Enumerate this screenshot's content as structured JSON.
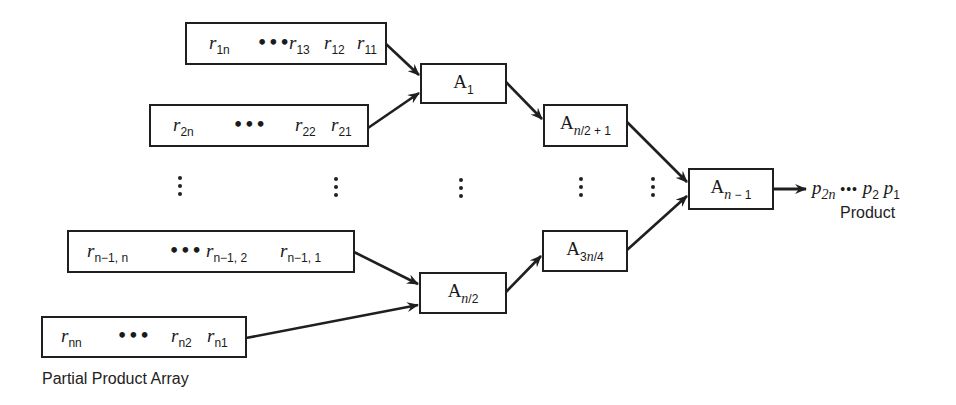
{
  "diagram": {
    "type": "tree-adder",
    "rows": [
      {
        "id": "row-1",
        "terms": [
          {
            "base": "r",
            "sub": "1n"
          },
          {
            "dots": "•••"
          },
          {
            "base": "r",
            "sub": "13"
          },
          {
            "base": "r",
            "sub": "12"
          },
          {
            "base": "r",
            "sub": "11"
          }
        ]
      },
      {
        "id": "row-2",
        "terms": [
          {
            "base": "r",
            "sub": "2n"
          },
          {
            "dots": "•••"
          },
          {
            "base": "r",
            "sub": "22"
          },
          {
            "base": "r",
            "sub": "21"
          }
        ]
      },
      {
        "id": "row-n-1",
        "terms": [
          {
            "base": "r",
            "sub": "n−1, n"
          },
          {
            "dots": "•••"
          },
          {
            "base": "r",
            "sub": "n−1, 2"
          },
          {
            "base": "r",
            "sub": "n−1, 1"
          }
        ]
      },
      {
        "id": "row-n",
        "terms": [
          {
            "base": "r",
            "sub": "nn"
          },
          {
            "dots": "•••"
          },
          {
            "base": "r",
            "sub": "n2"
          },
          {
            "base": "r",
            "sub": "n1"
          }
        ]
      }
    ],
    "adders": [
      {
        "id": "A1",
        "base": "A",
        "sub": "1"
      },
      {
        "id": "An2p1",
        "base": "A",
        "sub": "n/2 + 1"
      },
      {
        "id": "An1",
        "base": "A",
        "sub": "n − 1"
      },
      {
        "id": "A3n4",
        "base": "A",
        "sub": "3n/4"
      },
      {
        "id": "An2",
        "base": "A",
        "sub": "n/2"
      }
    ],
    "edges": [
      [
        "row-1",
        "A1"
      ],
      [
        "row-2",
        "A1"
      ],
      [
        "row-n-1",
        "An2"
      ],
      [
        "row-n",
        "An2"
      ],
      [
        "A1",
        "An2p1"
      ],
      [
        "An2",
        "A3n4"
      ],
      [
        "An2p1",
        "An1"
      ],
      [
        "A3n4",
        "An1"
      ],
      [
        "An1",
        "output"
      ]
    ],
    "output": {
      "terms": [
        {
          "base": "p",
          "sub": "2n"
        },
        {
          "dots": "•••"
        },
        {
          "base": "p",
          "sub": "2"
        },
        {
          "base": "p",
          "sub": "1"
        }
      ],
      "label": "Product"
    },
    "captions": {
      "partial_product_array": "Partial Product Array"
    },
    "ellipsis_vertical": "⋮"
  },
  "text": {
    "r": "r",
    "p": "p",
    "A": "A",
    "dots": "•••",
    "row1": {
      "t1": "1n",
      "t2": "13",
      "t3": "12",
      "t4": "11"
    },
    "row2": {
      "t1": "2n",
      "t2": "22",
      "t3": "21"
    },
    "rown1": {
      "t1": "n−1, n",
      "t2": "n−1, 2",
      "t3": "n−1, 1"
    },
    "rown": {
      "t1": "nn",
      "t2": "n2",
      "t3": "n1"
    },
    "a1": "1",
    "an2p1": "n/2 + 1",
    "an1": "n − 1",
    "a3n4": "3n/4",
    "an2": "n/2",
    "out": {
      "t1": "2n",
      "t2": "2",
      "t3": "1"
    },
    "product_label": "Product",
    "ppa_label": "Partial Product Array"
  },
  "colors": {
    "stroke": "#1f1f1f",
    "background": "#ffffff",
    "text": "#1a1a1a"
  }
}
